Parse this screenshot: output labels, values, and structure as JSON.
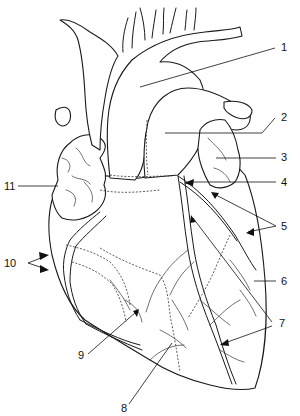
{
  "diagram": {
    "colors": {
      "line": "#1a1a1a",
      "background": "#ffffff"
    },
    "labels": [
      {
        "id": "1",
        "text": "1"
      },
      {
        "id": "2",
        "text": "2"
      },
      {
        "id": "3",
        "text": "3"
      },
      {
        "id": "4",
        "text": "4"
      },
      {
        "id": "5",
        "text": "5"
      },
      {
        "id": "6",
        "text": "6"
      },
      {
        "id": "7",
        "text": "7"
      },
      {
        "id": "8",
        "text": "8"
      },
      {
        "id": "9",
        "text": "9"
      },
      {
        "id": "10",
        "text": "10"
      },
      {
        "id": "11",
        "text": "11"
      }
    ]
  }
}
